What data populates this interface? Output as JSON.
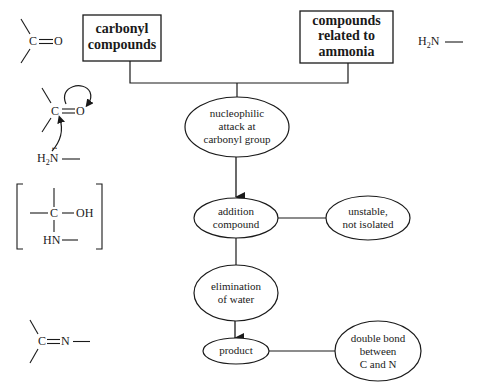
{
  "diagram": {
    "type": "flowchart",
    "topic": "Reaction of carbonyl compounds with ammonia derivatives",
    "boxes": [
      {
        "id": "carbonyl",
        "lines": [
          "carbonyl",
          "compounds"
        ]
      },
      {
        "id": "ammonia",
        "lines": [
          "compounds",
          "related to",
          "ammonia"
        ]
      }
    ],
    "nodes": [
      {
        "id": "attack",
        "lines": [
          "nucleophilic",
          "attack at",
          "carbonyl group"
        ]
      },
      {
        "id": "addition",
        "lines": [
          "addition",
          "compound"
        ]
      },
      {
        "id": "unstable",
        "lines": [
          "unstable,",
          "not isolated"
        ]
      },
      {
        "id": "elimination",
        "lines": [
          "elimination",
          "of water"
        ]
      },
      {
        "id": "product",
        "lines": [
          "product"
        ]
      },
      {
        "id": "double_bond",
        "lines": [
          "double bond",
          "between",
          "C and N"
        ]
      }
    ],
    "edges": [
      {
        "from": "carbonyl",
        "to": "attack",
        "style": "line"
      },
      {
        "from": "ammonia",
        "to": "attack",
        "style": "line"
      },
      {
        "from": "attack",
        "to": "addition",
        "style": "arrow"
      },
      {
        "from": "addition",
        "to": "unstable",
        "style": "line"
      },
      {
        "from": "addition",
        "to": "elimination",
        "style": "line"
      },
      {
        "from": "elimination",
        "to": "product",
        "style": "arrow"
      },
      {
        "from": "product",
        "to": "double_bond",
        "style": "line"
      }
    ]
  },
  "structures": {
    "carbonyl": {
      "c": "C",
      "bond": "=",
      "o": "O"
    },
    "amine": {
      "h2": "H",
      "sub": "2",
      "n": "N"
    },
    "mechanism": {
      "c": "C",
      "o": "O",
      "h2": "H",
      "sub": "2",
      "n": "N",
      "dots": "··"
    },
    "intermediate": {
      "c": "C",
      "oh": "OH",
      "hn": "HN"
    },
    "imine": {
      "c": "C",
      "n": "N"
    }
  }
}
